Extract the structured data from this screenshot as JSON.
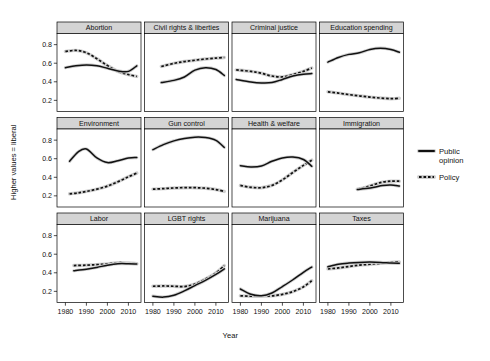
{
  "chart_data": {
    "type": "line",
    "title": "",
    "subtitle": "",
    "xlabel": "Year",
    "ylabel": "Higher values = liberal",
    "xlim": [
      1976,
      2016
    ],
    "ylim": [
      0.08,
      0.92
    ],
    "xticks": [
      1980,
      1990,
      2000,
      2010
    ],
    "xticklabels": [
      "1980",
      "1990",
      "2000",
      "2010"
    ],
    "yticks": [
      0.2,
      0.4,
      0.6,
      0.8
    ],
    "yticklabels": [
      "0.2",
      "0.4",
      "0.6",
      "0.8"
    ],
    "grid": false,
    "legend_position": "right",
    "layout": {
      "rows": 3,
      "cols": 4
    },
    "series_names": [
      "Public opinion",
      "Policy"
    ],
    "series_styles": [
      "solid",
      "dotted"
    ],
    "series_color": "#111111",
    "panels": [
      {
        "name": "Abortion",
        "x": [
          1980,
          1985,
          1990,
          1995,
          2000,
          2005,
          2010,
          2014
        ],
        "series": [
          {
            "name": "Public opinion",
            "values": [
              0.552,
              0.572,
              0.582,
              0.573,
              0.545,
              0.517,
              0.512,
              0.572
            ]
          },
          {
            "name": "Policy",
            "values": [
              0.727,
              0.738,
              0.713,
              0.648,
              0.575,
              0.512,
              0.478,
              0.458
            ]
          }
        ]
      },
      {
        "name": "Civil rights & liberties",
        "x": [
          1984,
          1990,
          1995,
          2000,
          2005,
          2010,
          2014
        ],
        "series": [
          {
            "name": "Public opinion",
            "values": [
              0.392,
              0.415,
              0.452,
              0.525,
              0.552,
              0.532,
              0.468
            ]
          },
          {
            "name": "Policy",
            "values": [
              0.565,
              0.598,
              0.618,
              0.632,
              0.645,
              0.655,
              0.662
            ]
          }
        ]
      },
      {
        "name": "Criminal justice",
        "x": [
          1978,
          1985,
          1990,
          1995,
          2000,
          2005,
          2010,
          2014
        ],
        "series": [
          {
            "name": "Public opinion",
            "values": [
              0.425,
              0.398,
              0.388,
              0.392,
              0.425,
              0.462,
              0.482,
              0.488
            ]
          },
          {
            "name": "Policy",
            "values": [
              0.528,
              0.512,
              0.492,
              0.462,
              0.452,
              0.478,
              0.512,
              0.548
            ]
          }
        ]
      },
      {
        "name": "Education spending",
        "x": [
          1980,
          1985,
          1990,
          1995,
          2000,
          2005,
          2010,
          2014
        ],
        "series": [
          {
            "name": "Public opinion",
            "values": [
              0.612,
              0.662,
              0.695,
              0.712,
              0.748,
              0.762,
              0.748,
              0.718
            ]
          },
          {
            "name": "Policy",
            "values": [
              0.292,
              0.278,
              0.262,
              0.248,
              0.235,
              0.225,
              0.218,
              0.222
            ]
          }
        ]
      },
      {
        "name": "Environment",
        "x": [
          1982,
          1986,
          1990,
          1995,
          2000,
          2005,
          2010,
          2014
        ],
        "series": [
          {
            "name": "Public opinion",
            "values": [
              0.572,
              0.672,
              0.705,
              0.608,
              0.558,
              0.578,
              0.608,
              0.612
            ]
          },
          {
            "name": "Policy",
            "values": [
              0.222,
              0.232,
              0.248,
              0.272,
              0.305,
              0.352,
              0.405,
              0.445
            ]
          }
        ]
      },
      {
        "name": "Gun control",
        "x": [
          1980,
          1985,
          1990,
          1995,
          2000,
          2005,
          2010,
          2014
        ],
        "series": [
          {
            "name": "Public opinion",
            "values": [
              0.698,
              0.752,
              0.792,
              0.818,
              0.832,
              0.828,
              0.798,
              0.722
            ]
          },
          {
            "name": "Policy",
            "values": [
              0.272,
              0.278,
              0.285,
              0.288,
              0.288,
              0.282,
              0.268,
              0.248
            ]
          }
        ]
      },
      {
        "name": "Health & welfare",
        "x": [
          1980,
          1985,
          1990,
          1995,
          2000,
          2005,
          2010,
          2014
        ],
        "series": [
          {
            "name": "Public opinion",
            "values": [
              0.525,
              0.512,
              0.522,
              0.572,
              0.608,
              0.618,
              0.592,
              0.518
            ]
          },
          {
            "name": "Policy",
            "values": [
              0.312,
              0.292,
              0.288,
              0.312,
              0.372,
              0.452,
              0.528,
              0.585
            ]
          }
        ]
      },
      {
        "name": "Immigration",
        "x": [
          1994,
          1998,
          2002,
          2006,
          2010,
          2014
        ],
        "series": [
          {
            "name": "Public opinion",
            "values": [
              0.268,
              0.278,
              0.292,
              0.312,
              0.318,
              0.305
            ]
          },
          {
            "name": "Policy",
            "values": [
              0.272,
              0.292,
              0.322,
              0.348,
              0.358,
              0.358
            ]
          }
        ]
      },
      {
        "name": "Labor",
        "x": [
          1984,
          1990,
          1995,
          2000,
          2005,
          2010,
          2014
        ],
        "series": [
          {
            "name": "Public opinion",
            "values": [
              0.422,
              0.438,
              0.458,
              0.482,
              0.498,
              0.498,
              0.495
            ]
          },
          {
            "name": "Policy",
            "values": [
              0.478,
              0.482,
              0.488,
              0.495,
              0.508,
              0.505,
              0.498
            ]
          }
        ]
      },
      {
        "name": "LGBT rights",
        "x": [
          1980,
          1985,
          1990,
          1995,
          2000,
          2005,
          2010,
          2014
        ],
        "series": [
          {
            "name": "Public opinion",
            "values": [
              0.148,
              0.138,
              0.158,
              0.205,
              0.262,
              0.318,
              0.382,
              0.442
            ]
          },
          {
            "name": "Policy",
            "values": [
              0.255,
              0.258,
              0.255,
              0.252,
              0.278,
              0.332,
              0.398,
              0.478
            ]
          }
        ]
      },
      {
        "name": "Marijuana",
        "x": [
          1980,
          1985,
          1990,
          1995,
          2000,
          2005,
          2010,
          2014
        ],
        "series": [
          {
            "name": "Public opinion",
            "values": [
              0.225,
              0.168,
              0.152,
              0.182,
              0.252,
              0.325,
              0.405,
              0.462
            ]
          },
          {
            "name": "Policy",
            "values": [
              0.152,
              0.148,
              0.148,
              0.152,
              0.168,
              0.198,
              0.248,
              0.315
            ]
          }
        ]
      },
      {
        "name": "Taxes",
        "x": [
          1980,
          1985,
          1990,
          1995,
          2000,
          2005,
          2010,
          2014
        ],
        "series": [
          {
            "name": "Public opinion",
            "values": [
              0.465,
              0.492,
              0.505,
              0.512,
              0.515,
              0.512,
              0.505,
              0.502
            ]
          },
          {
            "name": "Policy",
            "values": [
              0.442,
              0.452,
              0.468,
              0.482,
              0.492,
              0.502,
              0.512,
              0.518
            ]
          }
        ]
      }
    ]
  },
  "legend": {
    "items": [
      {
        "label_line1": "Public",
        "label_line2": "opinion",
        "style": "solid"
      },
      {
        "label_line1": "Policy",
        "label_line2": "",
        "style": "dotted"
      }
    ]
  },
  "axes": {
    "x_title": "Year",
    "y_title": "Higher values = liberal"
  }
}
